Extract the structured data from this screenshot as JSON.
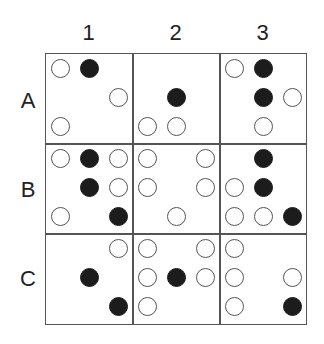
{
  "columns": [
    "1",
    "2",
    "3"
  ],
  "rows": [
    "A",
    "B",
    "C"
  ],
  "colors": {
    "filled": "#1c1c1c",
    "open_stroke": "#555555",
    "grid": "#555555"
  },
  "cells": {
    "A1": [
      {
        "r": 0,
        "c": 0,
        "t": "open"
      },
      {
        "r": 0,
        "c": 1,
        "t": "filled"
      },
      {
        "r": 1,
        "c": 2,
        "t": "open"
      },
      {
        "r": 2,
        "c": 0,
        "t": "open"
      }
    ],
    "A2": [
      {
        "r": 1,
        "c": 1,
        "t": "filled"
      },
      {
        "r": 2,
        "c": 0,
        "t": "open"
      },
      {
        "r": 2,
        "c": 1,
        "t": "open"
      }
    ],
    "A3": [
      {
        "r": 0,
        "c": 0,
        "t": "open"
      },
      {
        "r": 0,
        "c": 1,
        "t": "filled"
      },
      {
        "r": 1,
        "c": 1,
        "t": "filled"
      },
      {
        "r": 1,
        "c": 2,
        "t": "open"
      },
      {
        "r": 2,
        "c": 1,
        "t": "open"
      }
    ],
    "B1": [
      {
        "r": 0,
        "c": 0,
        "t": "open"
      },
      {
        "r": 0,
        "c": 1,
        "t": "filled"
      },
      {
        "r": 0,
        "c": 2,
        "t": "open"
      },
      {
        "r": 1,
        "c": 1,
        "t": "filled"
      },
      {
        "r": 1,
        "c": 2,
        "t": "open"
      },
      {
        "r": 2,
        "c": 0,
        "t": "open"
      },
      {
        "r": 2,
        "c": 2,
        "t": "filled"
      }
    ],
    "B2": [
      {
        "r": 0,
        "c": 0,
        "t": "open"
      },
      {
        "r": 0,
        "c": 2,
        "t": "open"
      },
      {
        "r": 1,
        "c": 0,
        "t": "open"
      },
      {
        "r": 1,
        "c": 2,
        "t": "open"
      },
      {
        "r": 2,
        "c": 1,
        "t": "open"
      }
    ],
    "B3": [
      {
        "r": 0,
        "c": 1,
        "t": "filled"
      },
      {
        "r": 1,
        "c": 0,
        "t": "open"
      },
      {
        "r": 1,
        "c": 1,
        "t": "filled"
      },
      {
        "r": 2,
        "c": 0,
        "t": "open"
      },
      {
        "r": 2,
        "c": 1,
        "t": "open"
      },
      {
        "r": 2,
        "c": 2,
        "t": "filled"
      }
    ],
    "C1": [
      {
        "r": 0,
        "c": 2,
        "t": "open"
      },
      {
        "r": 1,
        "c": 1,
        "t": "filled"
      },
      {
        "r": 2,
        "c": 2,
        "t": "filled"
      }
    ],
    "C2": [
      {
        "r": 0,
        "c": 0,
        "t": "open"
      },
      {
        "r": 0,
        "c": 2,
        "t": "open"
      },
      {
        "r": 1,
        "c": 0,
        "t": "open"
      },
      {
        "r": 1,
        "c": 1,
        "t": "filled"
      },
      {
        "r": 1,
        "c": 2,
        "t": "open"
      },
      {
        "r": 2,
        "c": 0,
        "t": "open"
      }
    ],
    "C3": [
      {
        "r": 0,
        "c": 0,
        "t": "open"
      },
      {
        "r": 1,
        "c": 0,
        "t": "open"
      },
      {
        "r": 1,
        "c": 2,
        "t": "open"
      },
      {
        "r": 2,
        "c": 0,
        "t": "open"
      },
      {
        "r": 2,
        "c": 2,
        "t": "filled"
      }
    ]
  }
}
